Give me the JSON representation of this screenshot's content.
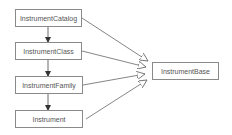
{
  "diagram": {
    "type": "class-hierarchy",
    "nodes": [
      {
        "id": "n0",
        "label": "InstrumentCatalog"
      },
      {
        "id": "n1",
        "label": "InstrumentClass"
      },
      {
        "id": "n2",
        "label": "InstrumentFamily"
      },
      {
        "id": "n3",
        "label": "Instrument"
      },
      {
        "id": "n4",
        "label": "InstrumentBase"
      }
    ],
    "edges": [
      {
        "from": "InstrumentCatalog",
        "to": "InstrumentClass",
        "style": "filled-arrow"
      },
      {
        "from": "InstrumentClass",
        "to": "InstrumentFamily",
        "style": "filled-arrow"
      },
      {
        "from": "InstrumentFamily",
        "to": "Instrument",
        "style": "filled-arrow"
      },
      {
        "from": "InstrumentCatalog",
        "to": "InstrumentBase",
        "style": "hollow-triangle"
      },
      {
        "from": "InstrumentClass",
        "to": "InstrumentBase",
        "style": "hollow-triangle"
      },
      {
        "from": "InstrumentFamily",
        "to": "InstrumentBase",
        "style": "hollow-triangle"
      },
      {
        "from": "Instrument",
        "to": "InstrumentBase",
        "style": "hollow-triangle"
      }
    ],
    "colors": {
      "border": "#8a8a8a",
      "text": "#555555",
      "edge": "#555555"
    }
  }
}
